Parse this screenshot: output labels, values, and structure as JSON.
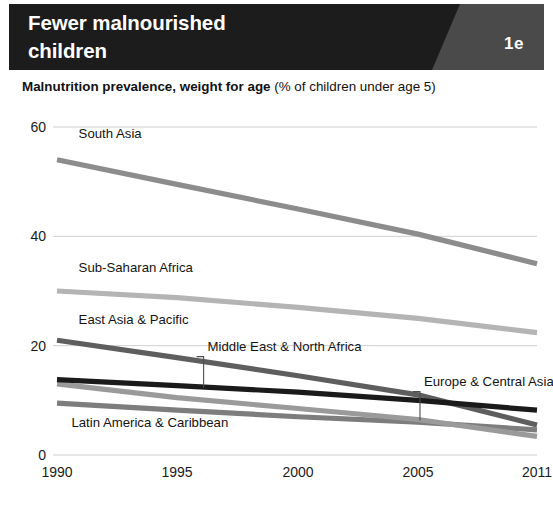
{
  "header": {
    "title": "Fewer malnourished\nchildren",
    "badge": "1e",
    "bg_color": "#1c1c1c",
    "badge_bg_color": "#4a4a4a",
    "text_color": "#ffffff"
  },
  "subtitle": {
    "bold_part": "Malnutrition prevalence, weight for age",
    "regular_part": " (% of children under age 5)"
  },
  "chart_data": {
    "type": "line",
    "title": "Fewer malnourished children",
    "subtitle": "Malnutrition prevalence, weight for age (% of children under age 5)",
    "xlabel": "",
    "ylabel": "",
    "x": [
      1990,
      1995,
      2000,
      2005,
      2011
    ],
    "xtick_labels": [
      "1990",
      "1995",
      "2000",
      "2005",
      "2011"
    ],
    "ytick_labels": [
      "0",
      "20",
      "40",
      "60"
    ],
    "yticks": [
      0,
      20,
      40,
      60
    ],
    "ylim": [
      0,
      60
    ],
    "xlim": [
      1990,
      2011
    ],
    "grid": "horizontal",
    "legend": "inline-labels",
    "series": [
      {
        "name": "South Asia",
        "color": "#8c8c8c",
        "values": [
          54.0,
          49.5,
          45.0,
          40.4,
          35.0
        ],
        "label_x": 1990.9,
        "label_y": 58.0,
        "leader": false
      },
      {
        "name": "Sub-Saharan Africa",
        "color": "#b4b4b4",
        "values": [
          30.0,
          28.8,
          27.0,
          25.0,
          22.4
        ],
        "label_x": 1990.9,
        "label_y": 33.5,
        "leader": false
      },
      {
        "name": "East Asia & Pacific",
        "color": "#5e5e5e",
        "values": [
          21.0,
          17.8,
          14.5,
          11.0,
          5.5
        ],
        "label_x": 1990.9,
        "label_y": 24.0,
        "leader": false
      },
      {
        "name": "Middle East & North Africa",
        "color": "#1a1a1a",
        "values": [
          13.8,
          12.7,
          11.5,
          10.0,
          8.2
        ],
        "label_x": 1996.5,
        "label_y": 19.0,
        "leader": true,
        "leader_x": 1996.1,
        "leader_y_top": 18.0,
        "leader_y_bottom": 12.3
      },
      {
        "name": "Europe & Central Asia",
        "color": "#9a9a9a",
        "values": [
          13.0,
          10.5,
          8.5,
          6.5,
          3.4
        ],
        "label_x": 2005.6,
        "label_y": 12.6,
        "leader": true,
        "leader_x": 2005.1,
        "leader_y_top": 11.6,
        "leader_y_bottom": 6.3
      },
      {
        "name": "Latin America & Caribbean",
        "color": "#7d7d7d",
        "values": [
          9.5,
          8.2,
          7.0,
          6.0,
          4.6
        ],
        "label_x": 1990.6,
        "label_y": 5.2,
        "leader": false
      }
    ]
  },
  "axis": {
    "line_color": "#cfcfcf",
    "tick_color": "#1a1a1a"
  }
}
